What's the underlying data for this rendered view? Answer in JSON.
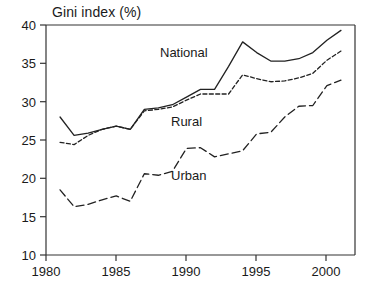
{
  "chart_data": {
    "type": "line",
    "title": "Gini index (%)",
    "xlabel": "",
    "ylabel": "Gini index (%)",
    "xlim": [
      1980,
      2002
    ],
    "ylim": [
      10,
      40
    ],
    "grid": false,
    "legend_position": "inline-annotations",
    "x_ticks": [
      1980,
      1985,
      1990,
      1995,
      2000
    ],
    "y_ticks": [
      10,
      15,
      20,
      25,
      30,
      35,
      40
    ],
    "x": [
      1981,
      1982,
      1983,
      1984,
      1985,
      1986,
      1987,
      1988,
      1989,
      1990,
      1991,
      1992,
      1993,
      1994,
      1995,
      1996,
      1997,
      1998,
      1999,
      2000,
      2001
    ],
    "series": [
      {
        "name": "National",
        "style": "solid",
        "color": "#222222",
        "label": "National",
        "values": [
          28.0,
          25.6,
          25.9,
          26.4,
          26.8,
          26.4,
          29.0,
          29.2,
          29.6,
          30.6,
          31.6,
          31.6,
          34.6,
          37.8,
          36.4,
          35.3,
          35.3,
          35.6,
          36.4,
          38.0,
          39.3
        ]
      },
      {
        "name": "Rural",
        "style": "dashed-short",
        "color": "#222222",
        "label": "Rural",
        "values": [
          24.7,
          24.4,
          25.6,
          26.4,
          26.8,
          26.4,
          28.8,
          29.0,
          29.3,
          30.2,
          31.0,
          31.0,
          31.0,
          33.5,
          33.0,
          32.6,
          32.7,
          33.1,
          33.7,
          35.4,
          36.6
        ]
      },
      {
        "name": "Urban",
        "style": "dashed-long",
        "color": "#222222",
        "label": "Urban",
        "values": [
          18.5,
          16.3,
          16.6,
          17.2,
          17.7,
          17.0,
          20.6,
          20.4,
          20.9,
          23.9,
          24.0,
          22.8,
          23.2,
          23.6,
          25.8,
          26.0,
          28.0,
          29.4,
          29.5,
          32.1,
          32.8
        ]
      }
    ]
  },
  "axis": {
    "y_tick_labels": [
      "40",
      "35",
      "30",
      "25",
      "20",
      "15",
      "10"
    ],
    "x_tick_labels": [
      "1980",
      "1985",
      "1990",
      "1995",
      "2000"
    ]
  },
  "annotations": {
    "national": "National",
    "rural": "Rural",
    "urban": "Urban"
  }
}
